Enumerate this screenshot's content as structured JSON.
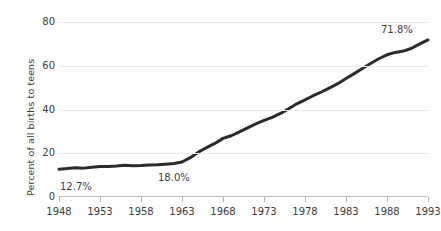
{
  "chart_data": {
    "type": "line",
    "title": "",
    "subtitle": "",
    "xlabel": "",
    "ylabel": "Percent of all births to teens",
    "xlim": [
      1948,
      1993
    ],
    "ylim": [
      0,
      80
    ],
    "grid": true,
    "legend": null,
    "legend_position": "none",
    "line_color": "#2b2b2b",
    "gridline_color": "#e9e9e9",
    "axis_color": "#bdbdbd",
    "y_ticks": [
      "0",
      "20",
      "40",
      "60",
      "80"
    ],
    "y_tick_values": [
      0,
      20,
      40,
      60,
      80
    ],
    "x_ticks": [
      "1948",
      "1953",
      "1958",
      "1963",
      "1968",
      "1973",
      "1978",
      "1983",
      "1988",
      "1993"
    ],
    "x_tick_values": [
      1948,
      1953,
      1958,
      1963,
      1968,
      1973,
      1978,
      1983,
      1988,
      1993
    ],
    "x": [
      1948,
      1949,
      1950,
      1951,
      1952,
      1953,
      1954,
      1955,
      1956,
      1957,
      1958,
      1959,
      1960,
      1961,
      1962,
      1963,
      1964,
      1965,
      1966,
      1967,
      1968,
      1969,
      1970,
      1971,
      1972,
      1973,
      1974,
      1975,
      1976,
      1977,
      1978,
      1979,
      1980,
      1981,
      1982,
      1983,
      1984,
      1985,
      1986,
      1987,
      1988,
      1989,
      1990,
      1991,
      1992,
      1993
    ],
    "values": [
      12.7,
      13.0,
      13.4,
      13.2,
      13.6,
      13.9,
      14.0,
      14.2,
      14.5,
      14.3,
      14.4,
      14.6,
      14.7,
      15.0,
      15.3,
      16.0,
      18.0,
      20.5,
      22.6,
      24.5,
      26.8,
      28.0,
      29.8,
      31.6,
      33.4,
      35.0,
      36.4,
      38.2,
      40.3,
      42.6,
      44.4,
      46.3,
      48.0,
      49.9,
      51.8,
      54.2,
      56.4,
      58.7,
      61.0,
      63.2,
      65.0,
      66.1,
      66.7,
      68.0,
      70.0,
      71.8
    ],
    "annotations": [
      {
        "name": "start-value",
        "text": "12.7%",
        "x": 1948,
        "y": 12.7
      },
      {
        "name": "mid-value",
        "text": "18.0%",
        "x": 1964,
        "y": 18.0
      },
      {
        "name": "end-value",
        "text": "71.8%",
        "x": 1993,
        "y": 71.8
      }
    ]
  }
}
